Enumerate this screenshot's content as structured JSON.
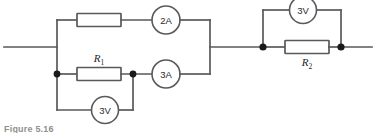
{
  "figure": {
    "caption": "Figure 5.16",
    "colors": {
      "wire": "#595959",
      "component_fill": "#ffffff",
      "node": "#1a1a1a",
      "text": "#2b2b2b",
      "background": "#ffffff"
    }
  },
  "components": {
    "resistors": [
      {
        "id": "r-top-left",
        "label": "",
        "name": "resistor-top-branch"
      },
      {
        "id": "r1",
        "label": "R",
        "subscript": "1",
        "name": "resistor-r1"
      },
      {
        "id": "r2",
        "label": "R",
        "subscript": "2",
        "name": "resistor-r2"
      }
    ],
    "ammeters": [
      {
        "id": "a-top",
        "reading": "2A",
        "name": "ammeter-2a"
      },
      {
        "id": "a-bottom",
        "reading": "3A",
        "name": "ammeter-3a"
      }
    ],
    "voltmeters": [
      {
        "id": "v-bottom-left",
        "reading": "3V",
        "name": "voltmeter-3v-left"
      },
      {
        "id": "v-top-right",
        "reading": "3V",
        "name": "voltmeter-3v-right"
      }
    ],
    "terminals": [
      {
        "id": "terminal-left",
        "name": "terminal-lead-left"
      },
      {
        "id": "terminal-right",
        "name": "terminal-lead-right"
      }
    ],
    "junctions": [
      {
        "id": "node-left-lower",
        "name": "junction-node-left-lower"
      },
      {
        "id": "node-mid-lower",
        "name": "junction-node-mid-lower"
      },
      {
        "id": "node-r2-left",
        "name": "junction-node-r2-left"
      },
      {
        "id": "node-r2-right",
        "name": "junction-node-r2-right"
      }
    ]
  }
}
